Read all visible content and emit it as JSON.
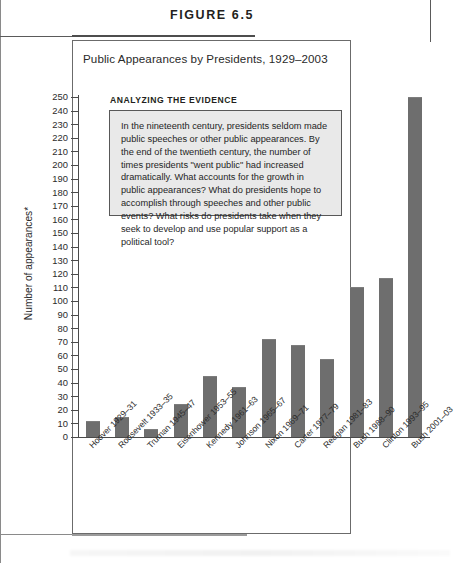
{
  "figure": {
    "label": "FIGURE 6.5",
    "title": "Public Appearances by Presidents, 1929–2003"
  },
  "callout": {
    "heading": "ANALYZING THE EVIDENCE",
    "body": "In the nineteenth century, presidents seldom made public speeches or other public appearances. By the end of the twentieth century, the number of times presidents \"went public\" had increased dramatically. What accounts for the growth in public appearances? What do presidents hope to accomplish through speeches and other public events? What risks do presidents take when they seek to develop and use popular support as a political tool?"
  },
  "colors": {
    "bar": "#6e6e6e",
    "axis": "#4a4a4a",
    "callout_background": "#e9e9e9",
    "callout_border": "#585858",
    "frame": "#6b6b6b",
    "text": "#231f20"
  },
  "chart_data": {
    "type": "bar",
    "title": "Public Appearances by Presidents, 1929–2003",
    "xlabel": "",
    "ylabel": "Number of appearances*",
    "ylim": [
      0,
      250
    ],
    "ytick_step": 10,
    "grid": false,
    "legend": "none",
    "ytick_labels": [
      "0",
      "10",
      "20",
      "30",
      "40",
      "50",
      "60",
      "70",
      "80",
      "90",
      "100",
      "110",
      "120",
      "130",
      "140",
      "150",
      "160",
      "170",
      "180",
      "190",
      "200",
      "210",
      "220",
      "230",
      "240",
      "250"
    ],
    "categories": [
      "Hoover 1929–31",
      "Roosevelt 1933–35",
      "Truman 1945–47",
      "Eisenhower 1953–55",
      "Kennedy 1961–63",
      "Johnson 1965–67",
      "Nixon 1969–71",
      "Carter 1977–79",
      "Reagan 1981–83",
      "Bush 1988–90",
      "Clinton 1993–95",
      "Bush 2001–03"
    ],
    "values": [
      12,
      15,
      6,
      24,
      45,
      37,
      72,
      68,
      57,
      110,
      117,
      250
    ]
  }
}
